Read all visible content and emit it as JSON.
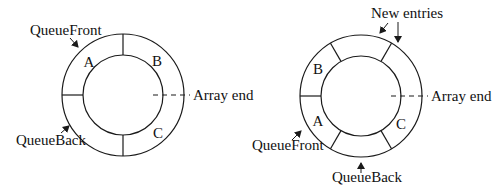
{
  "colors": {
    "ink": "#1a1a1a",
    "background": "#ffffff"
  },
  "left_diagram": {
    "center": [
      123,
      95
    ],
    "outer_radius": 61,
    "inner_radius": 40,
    "spoke_angles_deg": [
      90,
      180,
      270
    ],
    "slots": [
      {
        "label": "A",
        "x": 89,
        "y": 62
      },
      {
        "label": "B",
        "x": 157,
        "y": 61
      },
      {
        "label": "C",
        "x": 158,
        "y": 133
      }
    ],
    "labels": {
      "queue_front": "QueueFront",
      "queue_back": "QueueBack",
      "array_end": "Array end"
    }
  },
  "right_diagram": {
    "center": [
      361,
      96
    ],
    "outer_radius": 61,
    "inner_radius": 40,
    "spoke_angles_deg": [
      60,
      120,
      180,
      240,
      300
    ],
    "slots": [
      {
        "label": "B",
        "x": 318,
        "y": 69
      },
      {
        "label": "A",
        "x": 318,
        "y": 121
      },
      {
        "label": "C",
        "x": 401,
        "y": 124
      }
    ],
    "labels": {
      "new_entries": "New entries",
      "queue_front": "QueueFront",
      "queue_back": "QueueBack",
      "array_end": "Array end"
    }
  }
}
